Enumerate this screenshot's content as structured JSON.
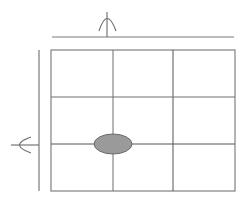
{
  "diagram": {
    "type": "grid-with-marker",
    "grid": {
      "rows": 3,
      "cols": 3,
      "col_x": [
        51,
        113,
        173,
        235
      ],
      "row_y": [
        50,
        97,
        144,
        191
      ],
      "line_color": "#6e6e6e",
      "border_color": "#8a8a8a"
    },
    "marker": {
      "shape": "ellipse",
      "cx": 113,
      "cy": 144,
      "rx": 19,
      "ry": 10,
      "fill": "#9a9a9a",
      "stroke": "#6a6a6a",
      "position": "intersection of column line 2 and row line 3"
    },
    "top_ruler": {
      "x1": 52,
      "x2": 234,
      "y": 37,
      "pointer_x": 107,
      "pointer_top": 12,
      "color": "#7a7a7a"
    },
    "left_ruler": {
      "x": 39,
      "y1": 50,
      "y2": 191,
      "pointer_y": 145,
      "pointer_left": 11,
      "color": "#7a7a7a"
    },
    "colors": {
      "background": "#ffffff",
      "lines": "#6e6e6e",
      "marker_fill": "#9a9a9a"
    }
  }
}
